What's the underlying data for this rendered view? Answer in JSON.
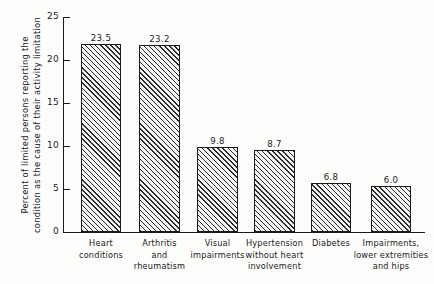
{
  "chart_data": {
    "type": "bar",
    "title": "",
    "xlabel": "",
    "ylabel_line1": "Percent of limited persons reporting the",
    "ylabel_line2": "condition as the cause of their activity limitation",
    "ylim": [
      0,
      25
    ],
    "grid": false,
    "legend": "none",
    "ytick_labels": [
      "0",
      "5",
      "10",
      "15",
      "20",
      "25"
    ],
    "ytick_values": [
      0,
      5,
      10,
      15,
      20,
      25
    ],
    "categories": [
      "Heart\nconditions",
      "Arthritis\nand\nrheumatism",
      "Visual\nimpairments",
      "Hypertension\nwithout heart\ninvolvement",
      "Diabetes",
      "Impairments,\nlower extremities\nand hips"
    ],
    "category_lines": [
      [
        "Heart",
        "conditions"
      ],
      [
        "Arthritis",
        "and",
        "rheumatism"
      ],
      [
        "Visual",
        "impairments"
      ],
      [
        "Hypertension",
        "without heart",
        "involvement"
      ],
      [
        "Diabetes"
      ],
      [
        "Impairments,",
        "lower extremities",
        "and hips"
      ]
    ],
    "values": [
      23.5,
      23.2,
      9.8,
      8.7,
      6.8,
      6.0
    ],
    "value_labels": [
      "23.5",
      "23.2",
      "9.8",
      "8.7",
      "6.8",
      "6.0"
    ],
    "drawn_heights": [
      21.9,
      21.7,
      9.9,
      9.5,
      5.7,
      5.3
    ],
    "bar_color": "#f4f4f2",
    "bar_edge_color": "#1a1a1a",
    "bar_hatch": "diagonal-45",
    "axis_color": "#1a1a1a",
    "background_color": "#fdfdfc",
    "bar_geometry": [
      {
        "left": 18,
        "width": 40
      },
      {
        "left": 76,
        "width": 41
      },
      {
        "left": 134,
        "width": 41
      },
      {
        "left": 191,
        "width": 41
      },
      {
        "left": 248,
        "width": 40
      },
      {
        "left": 308,
        "width": 40
      }
    ]
  }
}
